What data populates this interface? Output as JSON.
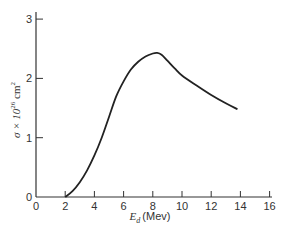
{
  "chart_data": {
    "type": "line",
    "title": "",
    "xlabel": "E_d (Mev)",
    "xlabel_main": "E",
    "xlabel_sub": "d",
    "xlabel_unit": "(Mev)",
    "ylabel": "σ × 10^26 cm^2",
    "ylabel_parts": {
      "sigma": "σ × 10",
      "exp": "26",
      "unit": " cm",
      "unit_exp": "2"
    },
    "xlim": [
      0,
      16
    ],
    "ylim": [
      0,
      3.2
    ],
    "x_ticks": [
      0,
      2,
      4,
      6,
      8,
      10,
      12,
      14,
      16
    ],
    "y_ticks": [
      0,
      1,
      2,
      3
    ],
    "grid": false,
    "legend": null,
    "series": [
      {
        "name": "cross section",
        "x": [
          2.0,
          2.5,
          3.0,
          3.5,
          4.0,
          4.5,
          5.0,
          5.5,
          6.0,
          6.5,
          7.0,
          7.5,
          8.0,
          8.3,
          8.6,
          9.0,
          9.5,
          10.0,
          11.0,
          12.0,
          13.0,
          13.8
        ],
        "y": [
          0.0,
          0.1,
          0.25,
          0.45,
          0.7,
          1.0,
          1.35,
          1.7,
          1.95,
          2.15,
          2.28,
          2.37,
          2.42,
          2.43,
          2.4,
          2.3,
          2.17,
          2.05,
          1.88,
          1.72,
          1.58,
          1.48
        ]
      }
    ]
  }
}
